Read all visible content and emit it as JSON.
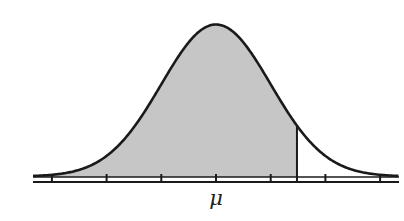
{
  "chart_data": {
    "type": "area",
    "title": "",
    "xlabel": "",
    "ylabel": "",
    "x_tick_labels": [
      "",
      "",
      "",
      "μ",
      "",
      "",
      ""
    ],
    "x_ticks_sigma": [
      -3,
      -2,
      -1,
      0,
      1,
      2,
      3
    ],
    "mean_label": "μ",
    "distribution": "normal",
    "mean": 0,
    "sd": 1,
    "shaded_region": {
      "from": "-inf",
      "to": 1.48
    },
    "xlim": [
      -3.4,
      3.4
    ],
    "grid": false,
    "legend": null
  },
  "colors": {
    "shade": "#c6c6c6",
    "curve": "#1a1a1a",
    "axis": "#1a1a1a",
    "background": "#ffffff"
  },
  "layout": {
    "mu_px": 216,
    "sigma_px": 54.7,
    "baseline_y": 177,
    "axis_y2": 182,
    "peak_y": 25,
    "axis_x_start": 33,
    "axis_x_end": 399
  }
}
